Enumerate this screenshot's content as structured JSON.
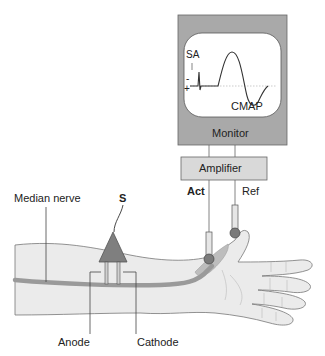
{
  "monitor": {
    "label": "Monitor",
    "screen": {
      "stimulus_artifact_label": "SA",
      "minus_sign": "-",
      "plus_sign": "+",
      "response_label": "CMAP"
    }
  },
  "amplifier": {
    "label": "Amplifier"
  },
  "electrodes": {
    "active_label": "Act",
    "reference_label": "Ref"
  },
  "stimulator": {
    "label": "S"
  },
  "nerve": {
    "label": "Median nerve"
  },
  "stim_poles": {
    "anode_label": "Anode",
    "cathode_label": "Cathode"
  },
  "colors": {
    "monitor_fill": "#a9a9a9",
    "screen_fill": "#ffffff",
    "amplifier_fill": "#d9d9d9",
    "skin_fill": "#ebebeb",
    "nerve_fill": "#a0a0a0",
    "electrode_dot": "#7a7a7a",
    "stimulator_fill": "#7f7f7f",
    "line": "#555555"
  }
}
